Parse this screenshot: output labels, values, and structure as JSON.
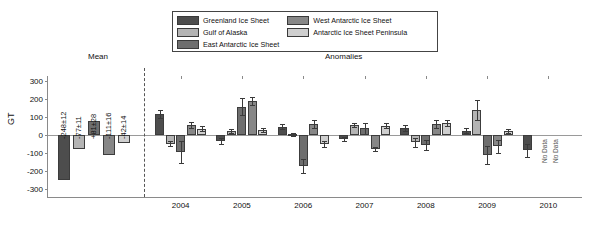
{
  "figure": {
    "ylabel": "GT",
    "section_mean": "Mean",
    "section_anomalies": "Anomalies",
    "no_data_label": "No Data"
  },
  "legend": {
    "col1": [
      {
        "label": "Greenland Ice Sheet",
        "color": "#4d4d4d"
      },
      {
        "label": "Gulf of Alaska",
        "color": "#b4b4b4"
      },
      {
        "label": "East Antarctic Ice Sheet",
        "color": "#6e6e6e"
      }
    ],
    "col2": [
      {
        "label": "West Antarctic Ice Sheet",
        "color": "#878787"
      },
      {
        "label": "Antarctic Ice Sheet Peninsula",
        "color": "#cfcfcf"
      }
    ]
  },
  "mean_labels": [
    "-248±12",
    "-77±11",
    "+81±28",
    "-111±16",
    "-42±14"
  ],
  "chart_data": {
    "type": "bar",
    "title": "",
    "xlabel": "",
    "ylabel": "GT",
    "ylim": [
      -350,
      330
    ],
    "yticks": [
      300,
      200,
      100,
      0,
      -100,
      -200,
      -300
    ],
    "ytick_labels": [
      "300",
      "200",
      "100",
      "0",
      "-100",
      "-200",
      "-300"
    ],
    "grid": false,
    "legend_position": "top-center",
    "categories": [
      "2004",
      "2005",
      "2006",
      "2007",
      "2008",
      "2009",
      "2010"
    ],
    "series": [
      {
        "name": "Greenland Ice Sheet",
        "color": "#4d4d4d",
        "mean": -248,
        "mean_error": 12,
        "mean_label": "-248±12",
        "values": [
          118,
          -33,
          46,
          -22,
          42,
          25,
          -85
        ],
        "errors": [
          22,
          18,
          14,
          12,
          16,
          15,
          38
        ]
      },
      {
        "name": "Gulf of Alaska",
        "color": "#b4b4b4",
        "mean": -77,
        "mean_error": 11,
        "mean_label": "-77±11",
        "values": [
          -48,
          22,
          5,
          55,
          -40,
          142,
          null
        ],
        "errors": [
          14,
          10,
          8,
          12,
          24,
          55,
          null
        ],
        "no_data": [
          "2010"
        ]
      },
      {
        "name": "East Antarctic Ice Sheet",
        "color": "#6e6e6e",
        "mean": 81,
        "mean_error": 28,
        "mean_label": "+81±28",
        "values": [
          -92,
          160,
          -170,
          38,
          -55,
          -110,
          null
        ],
        "errors": [
          62,
          48,
          40,
          30,
          28,
          52,
          null
        ],
        "no_data": [
          "2010"
        ]
      },
      {
        "name": "West Antarctic Ice Sheet",
        "color": "#878787",
        "mean": -111,
        "mean_error": 16,
        "mean_label": "-111±16",
        "values": [
          58,
          190,
          62,
          -78,
          62,
          -62,
          null
        ],
        "errors": [
          16,
          22,
          20,
          12,
          22,
          35,
          null
        ]
      },
      {
        "name": "Antarctic Ice Sheet Peninsula",
        "color": "#cfcfcf",
        "mean": -42,
        "mean_error": 14,
        "mean_label": "-42±14",
        "values": [
          36,
          30,
          -48,
          52,
          68,
          22,
          null
        ],
        "errors": [
          14,
          12,
          16,
          14,
          15,
          12,
          null
        ]
      }
    ]
  }
}
